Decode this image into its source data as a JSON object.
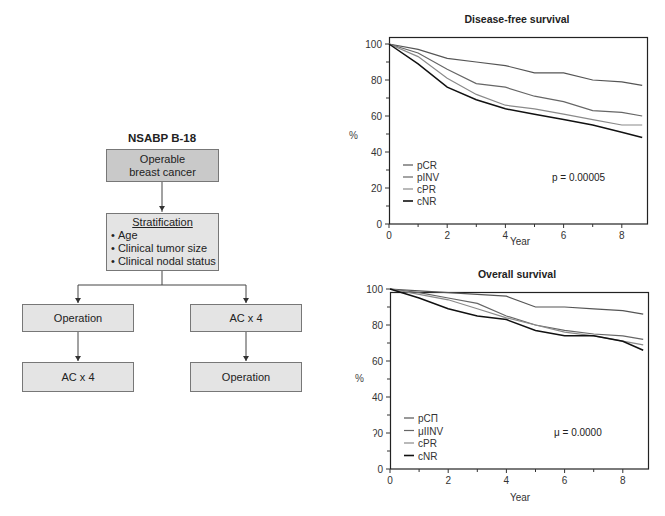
{
  "diagram": {
    "title": "NSABP B-18",
    "boxes": {
      "entry": {
        "lines": [
          "Operable",
          "breast cancer"
        ]
      },
      "stratification": {
        "heading": "Stratification",
        "items": [
          "Age",
          "Clinical tumor size",
          "Clinical nodal status"
        ]
      },
      "left_arm": {
        "first": "Operation",
        "second": "AC x 4"
      },
      "right_arm": {
        "first": "AC x 4",
        "second": "Operation"
      }
    },
    "colors": {
      "entry_fill": "#c9c9c9",
      "box_fill": "#e4e4e4",
      "border": "#777777"
    }
  },
  "chart_data": [
    {
      "type": "line",
      "title": "Disease-free survival",
      "xlabel": "Year",
      "ylabel": "%",
      "xlim": [
        0,
        8.8
      ],
      "ylim": [
        0,
        100
      ],
      "xticks": [
        0,
        2,
        4,
        6,
        8
      ],
      "yticks": [
        0,
        20,
        40,
        60,
        80,
        100
      ],
      "grid": false,
      "legend_position": "lower-left",
      "annotation": "p = 0.00005",
      "x": [
        0,
        1,
        2,
        3,
        4,
        5,
        6,
        7,
        8,
        8.7
      ],
      "series": [
        {
          "name": "pCR",
          "color": "#555555",
          "values": [
            100,
            97,
            92,
            90,
            88,
            84,
            84,
            80,
            79,
            77
          ]
        },
        {
          "name": "pINV",
          "color": "#666666",
          "values": [
            100,
            95,
            86,
            78,
            76,
            71,
            68,
            63,
            62,
            60
          ]
        },
        {
          "name": "cPR",
          "color": "#8a8a8a",
          "values": [
            100,
            93,
            81,
            72,
            66,
            64,
            61,
            58,
            55,
            55
          ]
        },
        {
          "name": "cNR",
          "color": "#111111",
          "values": [
            100,
            89,
            76,
            69,
            64,
            61,
            58,
            55,
            51,
            48
          ]
        }
      ]
    },
    {
      "type": "line",
      "title": "Overall survival",
      "xlabel": "Year",
      "ylabel": "%",
      "xlim": [
        0,
        8.8
      ],
      "ylim": [
        0,
        100
      ],
      "xticks": [
        0,
        2,
        4,
        6,
        8
      ],
      "yticks": [
        0,
        20,
        40,
        60,
        80,
        100
      ],
      "ytick_labels_rendered": [
        "0",
        "ʔ0",
        "40",
        "60",
        "80",
        "100"
      ],
      "grid": false,
      "legend_position": "lower-left",
      "annotation": "μ = 0.0000",
      "legend_labels_rendered": [
        "pCП",
        "μIINV",
        "cPR",
        "cNR"
      ],
      "x": [
        0,
        1,
        2,
        3,
        4,
        5,
        6,
        7,
        8,
        8.7
      ],
      "series": [
        {
          "name": "pCR",
          "color": "#555555",
          "values": [
            100,
            99,
            98,
            97,
            96,
            90,
            90,
            89,
            88,
            86
          ]
        },
        {
          "name": "pINV",
          "color": "#666666",
          "values": [
            100,
            98,
            95,
            92,
            85,
            80,
            77,
            75,
            74,
            72
          ]
        },
        {
          "name": "cPR",
          "color": "#8a8a8a",
          "values": [
            100,
            97,
            94,
            89,
            84,
            80,
            76,
            74,
            71,
            69
          ]
        },
        {
          "name": "cNR",
          "color": "#111111",
          "values": [
            100,
            95,
            89,
            85,
            83,
            77,
            74,
            74,
            71,
            66
          ]
        }
      ]
    }
  ]
}
